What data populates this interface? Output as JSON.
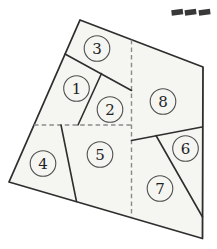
{
  "figure": {
    "type": "labeled-partition-diagram",
    "background": "#ffffff",
    "region_fill": "#f5f5f2",
    "line_color": "#2e2e2e",
    "dash_line_color": "#8a8a8a",
    "circle_stroke": "#4f4f4f",
    "label_color": "#222222",
    "circle_radius": 12.8,
    "outline": [
      [
        80,
        20
      ],
      [
        203,
        67
      ],
      [
        202.5,
        238.5
      ],
      [
        9,
        182
      ]
    ],
    "solid_lines": [
      {
        "name": "separator-3-below",
        "x1": 65,
        "y1": 54,
        "x2": 131.5,
        "y2": 90.5
      },
      {
        "name": "separator-1-2",
        "x1": 101.5,
        "y1": 73.5,
        "x2": 78,
        "y2": 125
      },
      {
        "name": "separator-4-5",
        "x1": 61,
        "y1": 125,
        "x2": 76.5,
        "y2": 201.5
      },
      {
        "name": "separator-8-below",
        "x1": 131.5,
        "y1": 140.5,
        "x2": 202,
        "y2": 127
      },
      {
        "name": "separator-6-7",
        "x1": 156,
        "y1": 135.5,
        "x2": 202.5,
        "y2": 217
      }
    ],
    "dashed_lines": [
      {
        "name": "vertical-dashed-partition",
        "x1": 131.5,
        "y1": 39.7,
        "x2": 131.5,
        "y2": 217
      },
      {
        "name": "horizontal-dashed-partition",
        "x1": 34,
        "y1": 125,
        "x2": 131.5,
        "y2": 125
      }
    ],
    "regions": [
      {
        "label": "1",
        "cx": 76.5,
        "cy": 88.5
      },
      {
        "label": "2",
        "cx": 110,
        "cy": 109.5
      },
      {
        "label": "3",
        "cx": 97,
        "cy": 48.5
      },
      {
        "label": "4",
        "cx": 43,
        "cy": 163.5
      },
      {
        "label": "5",
        "cx": 100,
        "cy": 154.5
      },
      {
        "label": "6",
        "cx": 185.5,
        "cy": 148.5
      },
      {
        "label": "7",
        "cx": 160,
        "cy": 188.5
      },
      {
        "label": "8",
        "cx": 163,
        "cy": 101.5
      }
    ]
  },
  "corner_marks": {
    "color": "#383838",
    "count": 3,
    "y": 9.5,
    "dash_width": 11.5,
    "dash_height": 5.5,
    "tilt_deg": -7,
    "x_positions": [
      171.5,
      184.8,
      198.8
    ]
  }
}
